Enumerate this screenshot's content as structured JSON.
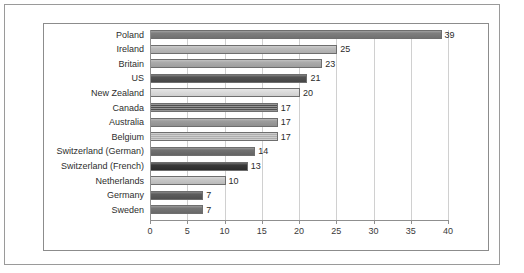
{
  "chart_data": {
    "type": "bar",
    "orientation": "horizontal",
    "title": "",
    "subtitle": "",
    "xlabel": "",
    "ylabel": "",
    "xlim": [
      0,
      40
    ],
    "ylim": null,
    "grid": true,
    "grid_axis": "x",
    "legend": false,
    "legend_position": "none",
    "data_labels": true,
    "xticks": [
      0,
      5,
      10,
      15,
      20,
      25,
      30,
      35,
      40
    ],
    "xtick_labels": [
      "0",
      "5",
      "10",
      "15",
      "20",
      "25",
      "30",
      "35",
      "40"
    ],
    "categories": [
      "Poland",
      "Ireland",
      "Britain",
      "US",
      "New Zealand",
      "Canada",
      "Australia",
      "Belgium",
      "Switzerland (German)",
      "Switzerland (French)",
      "Netherlands",
      "Germany",
      "Sweden"
    ],
    "values": [
      39,
      25,
      23,
      21,
      20,
      17,
      17,
      17,
      14,
      13,
      10,
      7,
      7
    ],
    "value_labels": [
      "39",
      "25",
      "23",
      "21",
      "20",
      "17",
      "17",
      "17",
      "14",
      "13",
      "10",
      "7",
      "7"
    ],
    "bar_colors": [
      "#787878",
      "#b8b8b8",
      "#a8a8a8",
      "#4a4a4a",
      "#dcdcdc",
      "#4f4f4f",
      "#989898",
      "#aeaeae",
      "#6a6a6a",
      "#2f2f2f",
      "#c6c6c6",
      "#555555",
      "#6f6f6f"
    ],
    "bar_textures": [
      "solid",
      "solid",
      "solid",
      "solid",
      "solid",
      "hlines",
      "solid",
      "hlines",
      "solid",
      "solid",
      "solid",
      "solid",
      "solid"
    ],
    "bar_border_color": "#6e6e6e",
    "plot_background": "#ffffff",
    "gridline_color": "#d0d0d0",
    "axis_color": "#8f8f8f",
    "frame_color": "#8c8c8c",
    "outer_frame_color": "#9a9a9a"
  }
}
